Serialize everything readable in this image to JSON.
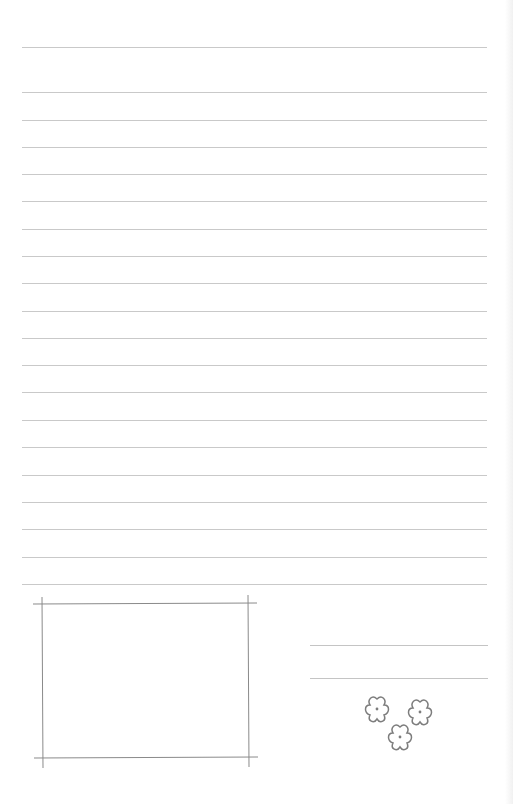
{
  "page": {
    "type": "ruled-stationery",
    "background": "#ffffff",
    "rule_color": "#c9c9c9",
    "rules_y": [
      47,
      92,
      120,
      147,
      174,
      201,
      229,
      256,
      283,
      311,
      338,
      365,
      392,
      420,
      447,
      475,
      502,
      529,
      557,
      584
    ]
  },
  "photo_frame": {
    "stroke": "#8a8a8a",
    "top_y": 604,
    "bottom_y": 758,
    "left_x": 42,
    "right_x": 248
  },
  "signature_lines_y": [
    645,
    678
  ],
  "flowers": [
    {
      "cx": 377,
      "cy": 709
    },
    {
      "cx": 420,
      "cy": 712
    },
    {
      "cx": 400,
      "cy": 737
    }
  ]
}
